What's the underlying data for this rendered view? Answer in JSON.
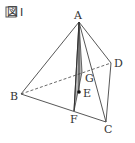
{
  "figure": {
    "title": "図 I",
    "title_box_glyph": "図",
    "title_numeral": "I"
  },
  "points": {
    "A": {
      "label": "A",
      "x": 79,
      "y": 22
    },
    "B": {
      "label": "B",
      "x": 21,
      "y": 94
    },
    "C": {
      "label": "C",
      "x": 106,
      "y": 122
    },
    "D": {
      "label": "D",
      "x": 111,
      "y": 63
    },
    "E": {
      "label": "E",
      "x": 79,
      "y": 92
    },
    "F": {
      "label": "F",
      "x": 74,
      "y": 111
    },
    "G": {
      "label": "G",
      "x": 82,
      "y": 72
    }
  },
  "colors": {
    "line": "#444444",
    "shade": "#b5b5b5",
    "text": "#333333"
  }
}
